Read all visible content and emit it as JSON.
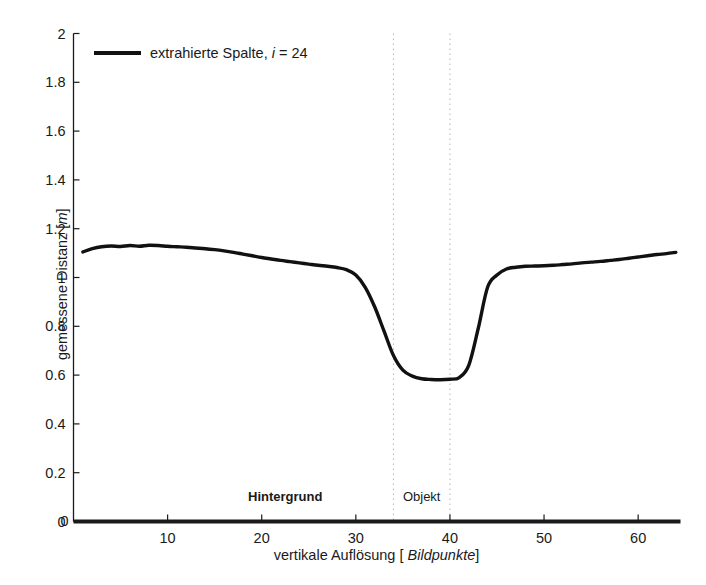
{
  "chart_data": {
    "type": "line",
    "title": "",
    "xlabel_parts": {
      "pre": "vertikale Auflösung [ ",
      "italic": "Bildpunkte",
      "post": "]"
    },
    "ylabel_parts": {
      "pre": "gemessene Distanz [",
      "italic": "m",
      "post": "]"
    },
    "xlabel": "vertikale Auflösung [ Bildpunkte]",
    "ylabel": "gemessene Distanz [m]",
    "xlim": [
      0,
      64.5
    ],
    "ylim": [
      0,
      2
    ],
    "xticks": [
      0,
      10,
      20,
      30,
      40,
      50,
      60
    ],
    "xtick_labels": [
      "0",
      "10",
      "20",
      "30",
      "40",
      "50",
      "60"
    ],
    "yticks": [
      0,
      0.2,
      0.4,
      0.6,
      0.8,
      1,
      1.2,
      1.4,
      1.6,
      1.8,
      2
    ],
    "ytick_labels": [
      "0",
      "0.2",
      "0.4",
      "0.6",
      "0.8",
      "1",
      "1.2",
      "1.4",
      "1.6",
      "1.8",
      "2"
    ],
    "grid": false,
    "legend_position": "top-left",
    "line_color": "#111111",
    "line_width": 3.4,
    "series": [
      {
        "name": "extrahierte Spalte, i = 24",
        "legend_label_pre": "extrahierte Spalte, ",
        "legend_label_italic": "i",
        "legend_label_post": " = 24",
        "x": [
          1,
          2,
          3,
          4,
          5,
          6,
          7,
          8,
          9,
          10,
          11,
          12,
          13,
          14,
          15,
          16,
          17,
          18,
          19,
          20,
          21,
          22,
          23,
          24,
          25,
          26,
          27,
          28,
          29,
          30,
          31,
          32,
          33,
          34,
          35,
          36,
          37,
          38,
          39,
          40,
          41,
          42,
          43,
          44,
          45,
          46,
          47,
          48,
          49,
          50,
          51,
          52,
          53,
          54,
          55,
          56,
          57,
          58,
          59,
          60,
          61,
          62,
          63,
          64
        ],
        "y": [
          1.105,
          1.118,
          1.126,
          1.129,
          1.127,
          1.131,
          1.128,
          1.132,
          1.131,
          1.128,
          1.126,
          1.124,
          1.121,
          1.118,
          1.114,
          1.109,
          1.103,
          1.096,
          1.089,
          1.082,
          1.076,
          1.07,
          1.065,
          1.06,
          1.055,
          1.05,
          1.046,
          1.041,
          1.032,
          1.01,
          0.96,
          0.88,
          0.78,
          0.68,
          0.62,
          0.596,
          0.585,
          0.582,
          0.581,
          0.583,
          0.59,
          0.64,
          0.79,
          0.96,
          1.01,
          1.035,
          1.042,
          1.046,
          1.047,
          1.048,
          1.05,
          1.053,
          1.056,
          1.06,
          1.063,
          1.066,
          1.07,
          1.074,
          1.079,
          1.084,
          1.089,
          1.094,
          1.098,
          1.103
        ]
      }
    ],
    "vlines": [
      {
        "x": 34,
        "style": "dotted",
        "color": "#bdbdbd"
      },
      {
        "x": 40,
        "style": "dotted",
        "color": "#bdbdbd"
      }
    ],
    "annotations": [
      {
        "text": "Hintergrund",
        "x": 22.5,
        "y": 0.1,
        "bold": true
      },
      {
        "text": "Objekt",
        "x": 37.0,
        "y": 0.1,
        "bold": false
      }
    ]
  },
  "axes": {
    "axis_color": "#1a1a1a",
    "background": "#ffffff"
  }
}
